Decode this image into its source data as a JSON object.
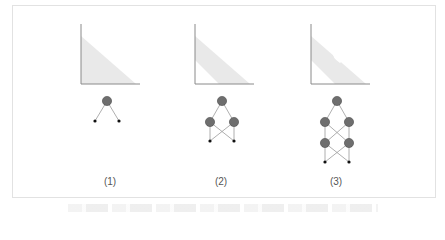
{
  "figure": {
    "panels": [
      {
        "label": "(1)",
        "region": "triangle",
        "hole": false,
        "hidden_layers": 0
      },
      {
        "label": "(2)",
        "region": "band",
        "hole": false,
        "hidden_layers": 1
      },
      {
        "label": "(3)",
        "region": "band",
        "hole": true,
        "hidden_layers": 2
      }
    ],
    "colors": {
      "axis": "#8a8a8a",
      "region_fill": "#e9e9e9",
      "node_fill": "#6e6e6e",
      "node_stroke": "#4a4a4a",
      "edge": "#9a9a9a",
      "input": "#111111",
      "frame": "#e2e2e2"
    }
  }
}
